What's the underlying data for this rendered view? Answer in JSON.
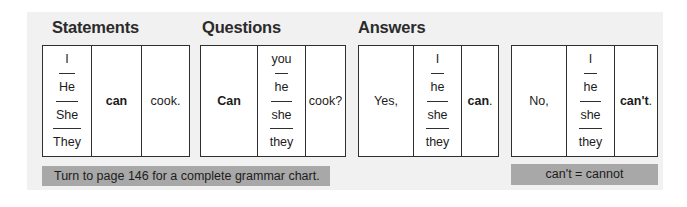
{
  "panel": {
    "background_color": "#f1f1f1",
    "page_background_color": "#ffffff"
  },
  "headings": {
    "statements": "Statements",
    "questions": "Questions",
    "answers": "Answers"
  },
  "colors": {
    "table_border": "#2f2f2f",
    "cell_background": "#ffffff",
    "callout_background": "#a8a8a8",
    "heading_text": "#2b2b2b",
    "body_text": "#1c1c1c"
  },
  "tables": {
    "statements": {
      "subjects": [
        "I",
        "He",
        "She",
        "They"
      ],
      "modal": "can",
      "verb": "cook."
    },
    "questions": {
      "modal": "Can",
      "subjects": [
        "you",
        "he",
        "she",
        "they"
      ],
      "verb": "cook?"
    },
    "answer_yes": {
      "lead": "Yes,",
      "subjects": [
        "I",
        "he",
        "she",
        "they"
      ],
      "modal": "can",
      "modal_tail": "."
    },
    "answer_no": {
      "lead": "No,",
      "subjects": [
        "I",
        "he",
        "she",
        "they"
      ],
      "modal": "can't",
      "modal_tail": "."
    }
  },
  "notes": {
    "page_reference": "Turn to page 146 for a complete grammar chart.",
    "contraction": "can't = cannot"
  }
}
